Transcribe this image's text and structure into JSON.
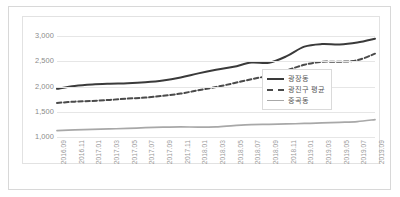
{
  "chart_data": {
    "type": "line",
    "title": "",
    "xlabel": "",
    "ylabel": "",
    "ylim": [
      1000,
      3000
    ],
    "yticks": [
      "1,000",
      "1,500",
      "2,000",
      "2,500",
      "3,000"
    ],
    "ytick_values": [
      1000,
      1500,
      2000,
      2500,
      3000
    ],
    "grid": true,
    "legend_position": "center-right",
    "categories": [
      "2016.09",
      "2016.11",
      "2017.01",
      "2017.03",
      "2017.05",
      "2017.07",
      "2017.09",
      "2017.11",
      "2018.01",
      "2018.03",
      "2018.05",
      "2018.07",
      "2018.09",
      "2018.11",
      "2019.01",
      "2019.03",
      "2019.05",
      "2019.07",
      "2019.09"
    ],
    "series": [
      {
        "name": "광장동",
        "style": "solid",
        "color": "#3a3a3a",
        "values": [
          1955,
          2010,
          2040,
          2055,
          2065,
          2085,
          2120,
          2180,
          2260,
          2330,
          2390,
          2475,
          2470,
          2600,
          2790,
          2840,
          2830,
          2870,
          2945
        ]
      },
      {
        "name": "광진구 평균",
        "style": "dashed",
        "color": "#4a4a4a",
        "values": [
          1675,
          1700,
          1715,
          1735,
          1760,
          1780,
          1815,
          1860,
          1925,
          1990,
          2065,
          2145,
          2215,
          2320,
          2430,
          2490,
          2490,
          2520,
          2650
        ]
      },
      {
        "name": "중곡동",
        "style": "solid",
        "color": "#a8a8a8",
        "values": [
          1125,
          1140,
          1150,
          1160,
          1170,
          1185,
          1195,
          1200,
          1195,
          1200,
          1225,
          1245,
          1250,
          1258,
          1268,
          1278,
          1290,
          1305,
          1345
        ]
      }
    ]
  },
  "legend": {
    "items": [
      {
        "label": "광장동"
      },
      {
        "label": "광진구 평균"
      },
      {
        "label": "중곡동"
      }
    ]
  }
}
